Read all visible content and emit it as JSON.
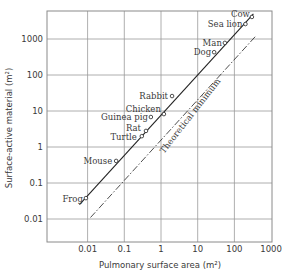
{
  "chart_data": {
    "type": "scatter",
    "title": "",
    "xlabel": "Pulmonary surface area (m²)",
    "ylabel": "Surface-active material (m²)",
    "xscale": "log",
    "yscale": "log",
    "xlim": [
      0.001,
      1000
    ],
    "ylim": [
      0.002,
      5000
    ],
    "grid": true,
    "x_ticks": [
      "0.01",
      "0.1",
      "1",
      "10",
      "100",
      "1000"
    ],
    "y_ticks": [
      "0.01",
      "0.1",
      "1",
      "10",
      "100",
      "1000"
    ],
    "points": [
      {
        "label": "Frog",
        "x": 0.009,
        "y": 0.038
      },
      {
        "label": "Mouse",
        "x": 0.06,
        "y": 0.41
      },
      {
        "label": "Turtle",
        "x": 0.3,
        "y": 2.0
      },
      {
        "label": "Rat",
        "x": 0.39,
        "y": 2.8
      },
      {
        "label": "Guinea pig",
        "x": 0.53,
        "y": 6.8
      },
      {
        "label": "Chicken",
        "x": 1.2,
        "y": 8.2
      },
      {
        "label": "Rabbit",
        "x": 2.0,
        "y": 26
      },
      {
        "label": "Dog",
        "x": 28,
        "y": 430
      },
      {
        "label": "Man",
        "x": 55,
        "y": 780
      },
      {
        "label": "Sea lion",
        "x": 200,
        "y": 2600
      },
      {
        "label": "Cow",
        "x": 300,
        "y": 4100
      }
    ],
    "lines": [
      {
        "name": "fit",
        "style": "solid",
        "from": {
          "x": 0.006,
          "y": 0.025
        },
        "to": {
          "x": 330,
          "y": 5000
        }
      },
      {
        "name": "Theoretical minimum",
        "style": "dashdot",
        "from": {
          "x": 0.012,
          "y": 0.011
        },
        "to": {
          "x": 380,
          "y": 1200
        }
      }
    ],
    "annotations": [
      "Theoretical minimum"
    ]
  }
}
